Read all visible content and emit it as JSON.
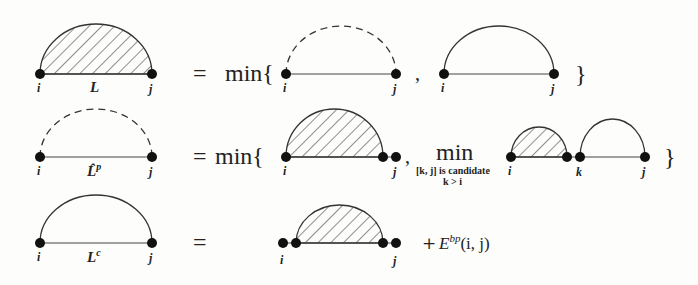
{
  "rows": [
    {
      "lhs": {
        "label_i": "i",
        "label_j": "j",
        "label": "L",
        "arc_style": "hatched"
      },
      "equals": "=",
      "rhs": {
        "operator": "min{",
        "terms": [
          {
            "arc_style": "dashed",
            "label_i": "i",
            "label_j": "j"
          },
          {
            "arc_style": "solid",
            "label_i": "i",
            "label_j": "j"
          }
        ],
        "separator": ",",
        "close": "}"
      }
    },
    {
      "lhs": {
        "label_i": "i",
        "label_j": "j",
        "label": "L̂",
        "label_sup": "p",
        "arc_style": "dashed"
      },
      "equals": "=",
      "rhs": {
        "operator": "min{",
        "terms": [
          {
            "arc_style": "hatched",
            "label_i": "i",
            "label_j": "j",
            "double_dot_right": true
          },
          {
            "inner_min": "min",
            "subscript_line1": "[k, j] is candidate",
            "subscript_line2": "k > i",
            "arcs": [
              {
                "arc_style": "hatched",
                "label_i": "i"
              },
              {
                "arc_style": "solid",
                "label_k": "k",
                "label_j": "j"
              }
            ]
          }
        ],
        "separator": ",",
        "close": "}"
      }
    },
    {
      "lhs": {
        "label_i": "i",
        "label_j": "j",
        "label": "L",
        "label_sup": "c",
        "arc_style": "solid"
      },
      "equals": "=",
      "rhs": {
        "terms": [
          {
            "arc_style": "hatched",
            "label_i": "i",
            "label_j": "j",
            "double_dot_left": true,
            "double_dot_right": true
          }
        ],
        "plus": "+",
        "energy": "E",
        "energy_sup": "bp",
        "energy_args": "(i, j)"
      }
    }
  ]
}
